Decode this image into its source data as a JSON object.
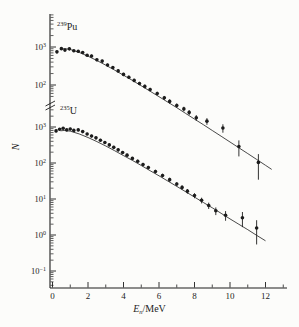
{
  "figure": {
    "background": "#fcfcfa",
    "ink": "#1c1c1c"
  },
  "chart_data": {
    "type": "scatter",
    "title": "",
    "ylabel": "N",
    "xlabel": {
      "variable": "E",
      "subscript": "n",
      "unit": "/MeV"
    },
    "x_axis": {
      "min": 0,
      "max": 13.2,
      "major_ticks": [
        0,
        2,
        4,
        6,
        8,
        10,
        12
      ],
      "minor_ticks": [
        1,
        3,
        5,
        7,
        9,
        11,
        13
      ]
    },
    "axis_break": true,
    "upper_scale": {
      "isotope_label": {
        "mass": "239",
        "element": "Pu"
      },
      "tick_exponents": [
        3,
        2
      ],
      "tick_labels": [
        "10^3",
        "10^2"
      ]
    },
    "lower_scale": {
      "isotope_label": {
        "mass": "235",
        "element": "U"
      },
      "tick_exponents": [
        3,
        2,
        1,
        0,
        -1
      ],
      "tick_labels": [
        "10^3",
        "10^2",
        "10^1",
        "10^0",
        "10^-1"
      ]
    },
    "series": [
      {
        "name": "239Pu",
        "scale": "upper",
        "marker": "filled-circle",
        "points": [
          [
            0.25,
            745,
            0.09
          ],
          [
            0.5,
            905,
            0.08
          ],
          [
            0.7,
            830,
            0.08
          ],
          [
            0.95,
            895,
            0.08
          ],
          [
            1.2,
            795,
            0.08
          ],
          [
            1.45,
            770,
            0.08
          ],
          [
            1.7,
            715,
            0.08
          ],
          [
            1.95,
            605,
            0.08
          ],
          [
            2.2,
            580,
            0.09
          ],
          [
            2.5,
            460,
            0.09
          ],
          [
            2.8,
            425,
            0.09
          ],
          [
            3.1,
            335,
            0.09
          ],
          [
            3.4,
            290,
            0.09
          ],
          [
            3.7,
            235,
            0.1
          ],
          [
            4.0,
            190,
            0.1
          ],
          [
            4.3,
            160,
            0.1
          ],
          [
            4.6,
            132,
            0.1
          ],
          [
            4.9,
            110,
            0.1
          ],
          [
            5.2,
            92,
            0.11
          ],
          [
            5.5,
            76,
            0.11
          ],
          [
            5.9,
            60,
            0.11
          ],
          [
            6.3,
            46,
            0.12
          ],
          [
            6.6,
            37,
            0.13
          ],
          [
            7.0,
            29,
            0.13
          ],
          [
            7.4,
            23.5,
            0.14
          ],
          [
            7.7,
            19,
            0.15
          ],
          [
            8.1,
            13.8,
            0.17
          ],
          [
            8.7,
            11.2,
            0.2
          ],
          [
            9.6,
            7.4,
            0.25
          ],
          [
            10.5,
            2.4,
            0.45
          ],
          [
            11.6,
            0.92,
            0.65
          ]
        ],
        "fit_line": [
          [
            0.45,
            880
          ],
          [
            0.7,
            900
          ],
          [
            1,
            860
          ],
          [
            1.5,
            723
          ],
          [
            2,
            574
          ],
          [
            2.5,
            440
          ],
          [
            3,
            332
          ],
          [
            3.5,
            246
          ],
          [
            4,
            181
          ],
          [
            4.5,
            132
          ],
          [
            5,
            95
          ],
          [
            5.5,
            68.7
          ],
          [
            6,
            49.3
          ],
          [
            6.5,
            35.3
          ],
          [
            7,
            25.2
          ],
          [
            7.5,
            17.9
          ],
          [
            8,
            12.7
          ],
          [
            8.5,
            9.0
          ],
          [
            9,
            6.35
          ],
          [
            9.5,
            4.49
          ],
          [
            10,
            3.16
          ],
          [
            10.5,
            2.23
          ],
          [
            11,
            1.57
          ],
          [
            11.5,
            1.1
          ],
          [
            12,
            0.77
          ],
          [
            12.35,
            0.6
          ]
        ]
      },
      {
        "name": "235U",
        "scale": "lower",
        "marker": "filled-circle",
        "points": [
          [
            0.2,
            780,
            0.09
          ],
          [
            0.4,
            870,
            0.08
          ],
          [
            0.6,
            920,
            0.08
          ],
          [
            0.8,
            830,
            0.08
          ],
          [
            1.0,
            880,
            0.08
          ],
          [
            1.2,
            805,
            0.08
          ],
          [
            1.45,
            830,
            0.08
          ],
          [
            1.7,
            745,
            0.08
          ],
          [
            1.95,
            640,
            0.08
          ],
          [
            2.2,
            560,
            0.09
          ],
          [
            2.45,
            500,
            0.09
          ],
          [
            2.7,
            430,
            0.09
          ],
          [
            2.95,
            370,
            0.09
          ],
          [
            3.2,
            318,
            0.09
          ],
          [
            3.45,
            272,
            0.1
          ],
          [
            3.7,
            232,
            0.1
          ],
          [
            3.95,
            196,
            0.1
          ],
          [
            4.2,
            165,
            0.1
          ],
          [
            4.5,
            134,
            0.1
          ],
          [
            4.8,
            112,
            0.11
          ],
          [
            5.1,
            91,
            0.11
          ],
          [
            5.4,
            75,
            0.11
          ],
          [
            5.8,
            58,
            0.12
          ],
          [
            6.2,
            45,
            0.12
          ],
          [
            6.6,
            34.5,
            0.13
          ],
          [
            7.0,
            26,
            0.13
          ],
          [
            7.3,
            21,
            0.14
          ],
          [
            7.6,
            16.5,
            0.15
          ],
          [
            8.0,
            12.5,
            0.16
          ],
          [
            8.4,
            9.2,
            0.18
          ],
          [
            8.8,
            6.6,
            0.2
          ],
          [
            9.2,
            4.7,
            0.24
          ],
          [
            9.75,
            3.55,
            0.3
          ],
          [
            10.7,
            3.0,
            0.45
          ],
          [
            11.5,
            1.56,
            0.65
          ]
        ],
        "fit_line": [
          [
            0.45,
            784
          ],
          [
            0.7,
            802
          ],
          [
            1,
            766
          ],
          [
            1.5,
            644
          ],
          [
            2,
            511
          ],
          [
            2.5,
            392
          ],
          [
            3,
            296
          ],
          [
            3.5,
            219
          ],
          [
            4,
            161
          ],
          [
            4.5,
            118
          ],
          [
            5,
            85
          ],
          [
            5.5,
            61
          ],
          [
            6,
            44
          ],
          [
            6.5,
            31.4
          ],
          [
            7,
            22.4
          ],
          [
            7.5,
            16
          ],
          [
            8,
            11.3
          ],
          [
            8.5,
            8.0
          ],
          [
            9,
            5.7
          ],
          [
            9.5,
            4.0
          ],
          [
            10,
            2.8
          ],
          [
            10.5,
            1.98
          ],
          [
            11,
            1.4
          ],
          [
            11.5,
            0.98
          ],
          [
            12,
            0.69
          ]
        ]
      }
    ]
  }
}
